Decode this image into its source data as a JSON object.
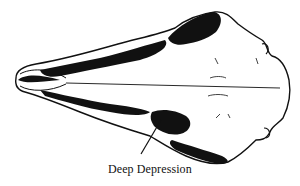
{
  "figure": {
    "colors": {
      "ink": "#111111",
      "background": "#ffffff"
    }
  },
  "annotations": [
    {
      "label": "Deep Depression"
    }
  ]
}
